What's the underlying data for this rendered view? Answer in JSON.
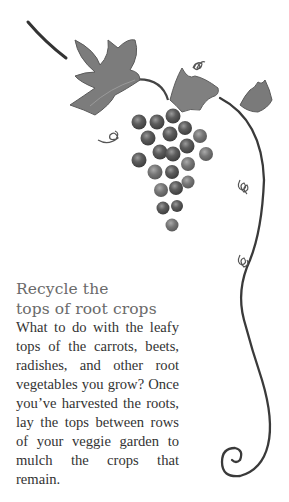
{
  "article": {
    "heading_line1": "Recycle the",
    "heading_line2": "tops of root crops",
    "body": "What to do with the leafy tops of the carrots, beets, radishes, and other root vegetables you grow? Once you’ve harvested the roots, lay the tops between rows of your veggie garden to mulch the crops that remain."
  },
  "illustration": {
    "subject": "grape-vine-illustration",
    "colors": {
      "vine": "#3a3a3a",
      "leaf": "#7a7a7a",
      "grape": "#5a5a5a"
    }
  }
}
